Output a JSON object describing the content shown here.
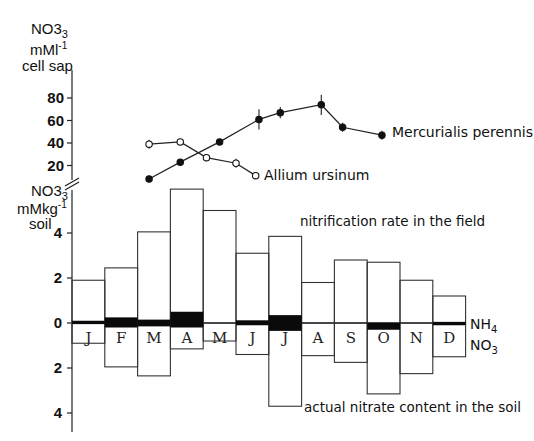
{
  "chart_data": [
    {
      "type": "line",
      "title": "",
      "ylabel": "NO3 mM l-1 cell sap",
      "ylabel_lines": [
        "NO3",
        "mM l-1",
        "cell sap"
      ],
      "yticks": [
        20,
        40,
        60,
        80
      ],
      "ylim": [
        0,
        90
      ],
      "x_unit": "month position (0=Jan start, 12=Dec end)",
      "series": [
        {
          "name": "Mercurialis perennis",
          "marker": "filled-circle",
          "x": [
            2.35,
            3.3,
            4.5,
            5.7,
            6.35,
            7.6,
            8.25,
            9.45
          ],
          "values": [
            8,
            23,
            41,
            61,
            67,
            74,
            54,
            47
          ],
          "error_bars": [
            0,
            0,
            0,
            9,
            5,
            9,
            4,
            4
          ]
        },
        {
          "name": "Allium ursinum",
          "marker": "open-circle",
          "x": [
            2.35,
            3.3,
            4.1,
            5.0,
            5.6
          ],
          "values": [
            39,
            41,
            27,
            22,
            11
          ],
          "error_bars": [
            4,
            0,
            0,
            4,
            0
          ]
        }
      ]
    },
    {
      "type": "bar",
      "title": "",
      "ylabel": "NO3 mM kg-1 soil",
      "ylabel_lines": [
        "NO3",
        "mMkg-1",
        "soil"
      ],
      "categories": [
        "J",
        "F",
        "M",
        "A",
        "M",
        "J",
        "J",
        "A",
        "S",
        "O",
        "N",
        "D"
      ],
      "yticks_up": [
        0,
        2,
        4
      ],
      "yticks_down": [
        2,
        4
      ],
      "ylim": [
        -4.2,
        6.2
      ],
      "series": [
        {
          "name": "nitrification rate in the field",
          "direction": "up",
          "values": [
            1.9,
            2.45,
            4.05,
            5.95,
            5.0,
            3.1,
            3.85,
            1.8,
            2.8,
            2.7,
            1.9,
            1.2
          ]
        },
        {
          "name": "actual nitrate content in the soil",
          "direction": "down",
          "values": [
            0.9,
            1.95,
            2.35,
            1.15,
            0.8,
            1.4,
            3.7,
            1.45,
            1.75,
            3.15,
            2.25,
            1.5
          ]
        },
        {
          "name": "NH4",
          "direction": "band",
          "above": [
            0.1,
            0.25,
            0.15,
            0.5,
            0.0,
            0.12,
            0.35,
            0.0,
            0.0,
            0.0,
            0.0,
            0.05
          ],
          "below": [
            0.05,
            0.2,
            0.15,
            0.2,
            0.0,
            0.1,
            0.35,
            0.0,
            0.0,
            0.3,
            0.0,
            0.1
          ]
        }
      ],
      "annotations": {
        "up_series": "nitrification rate in the field",
        "down_series": "actual nitrate content in the soil",
        "band_top": "NH4",
        "band_bottom": "NO3"
      }
    }
  ],
  "labels": {
    "upper_axis": [
      "NO3",
      "mMl",
      "-1",
      "cell sap"
    ],
    "lower_axis": [
      "NO3",
      "mMkg",
      "-1",
      "soil"
    ],
    "legend_mercurialis": "Mercurialis perennis",
    "legend_allium": "Allium ursinum",
    "nitrification": "nitrification rate in the field",
    "nitrate_content": "actual nitrate content in the soil",
    "nh4": "NH",
    "nh4_sub": "4",
    "no3": "NO",
    "no3_sub": "3"
  }
}
